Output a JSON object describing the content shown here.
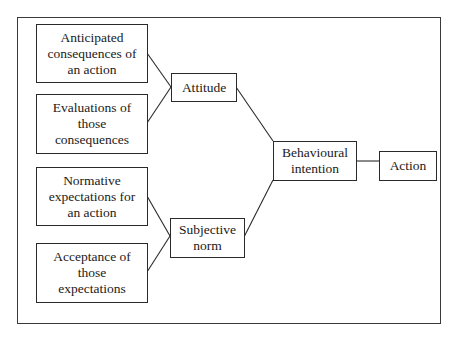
{
  "diagram": {
    "inputs": [
      {
        "id": "anticipated",
        "lines": [
          "Anticipated",
          "consequences of",
          "an action"
        ]
      },
      {
        "id": "evaluations",
        "lines": [
          "Evaluations of",
          "those",
          "consequences"
        ]
      },
      {
        "id": "normative",
        "lines": [
          "Normative",
          "expectations for",
          "an action"
        ]
      },
      {
        "id": "acceptance",
        "lines": [
          "Acceptance of",
          "those",
          "expectations"
        ]
      }
    ],
    "attitude": {
      "label": "Attitude"
    },
    "subjective_norm": {
      "lines": [
        "Subjective",
        "norm"
      ]
    },
    "behavioural_intention": {
      "lines": [
        "Behavioural",
        "intention"
      ]
    },
    "action": {
      "label": "Action"
    },
    "edges": [
      [
        "Anticipated consequences of an action",
        "Attitude"
      ],
      [
        "Evaluations of those consequences",
        "Attitude"
      ],
      [
        "Normative expectations for an action",
        "Subjective norm"
      ],
      [
        "Acceptance of those expectations",
        "Subjective norm"
      ],
      [
        "Attitude",
        "Behavioural intention"
      ],
      [
        "Subjective norm",
        "Behavioural intention"
      ],
      [
        "Behavioural intention",
        "Action"
      ]
    ],
    "line_color": "#2a2a2a"
  }
}
